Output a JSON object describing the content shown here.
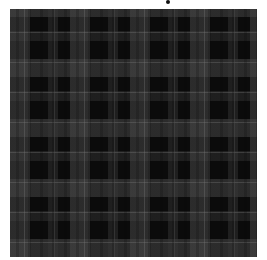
{
  "image": {
    "subject": "black and dark gray tartan plaid fabric texture",
    "colors": {
      "background": "#ffffff",
      "dark": "#0b0b0b",
      "band": "#3a3a3a",
      "pinstripe": "#6e6e6e"
    }
  }
}
